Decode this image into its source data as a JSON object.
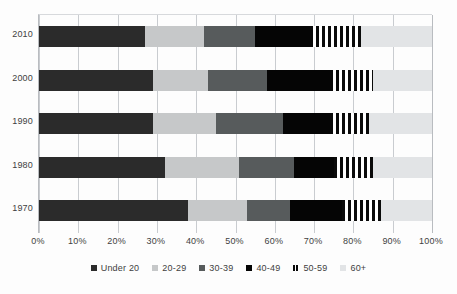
{
  "chart_data": {
    "type": "bar",
    "orientation": "horizontal",
    "stacked": true,
    "normalized": true,
    "title": "",
    "subtitle": "",
    "xlabel": "",
    "ylabel": "",
    "xlim": [
      0,
      100
    ],
    "grid": true,
    "legend_position": "bottom",
    "categories": [
      "2010",
      "2000",
      "1990",
      "1980",
      "1970"
    ],
    "xticks": [
      "0%",
      "10%",
      "20%",
      "30%",
      "40%",
      "50%",
      "60%",
      "70%",
      "80%",
      "90%",
      "100%"
    ],
    "xtick_values": [
      0,
      10,
      20,
      30,
      40,
      50,
      60,
      70,
      80,
      90,
      100
    ],
    "series": [
      {
        "name": "Under 20",
        "color": "#2b2b2b",
        "values": [
          27,
          29,
          29,
          32,
          38
        ]
      },
      {
        "name": "20-29",
        "color": "#c6c8c9",
        "values": [
          15,
          14,
          16,
          19,
          15
        ]
      },
      {
        "name": "30-39",
        "color": "#575b5c",
        "values": [
          13,
          15,
          17,
          14,
          11
        ]
      },
      {
        "name": "40-49",
        "color": "#050505",
        "values": [
          14,
          16,
          12,
          10,
          13
        ]
      },
      {
        "name": "50-59",
        "color": "#0a0a0a",
        "pattern": "vertical-stripes",
        "values": [
          13,
          11,
          10,
          10,
          10
        ]
      },
      {
        "name": "60+",
        "color": "#e2e4e6",
        "values": [
          18,
          15,
          16,
          15,
          13
        ]
      }
    ]
  },
  "legend": {
    "items": [
      {
        "label": "Under 20"
      },
      {
        "label": "20-29"
      },
      {
        "label": "30-39"
      },
      {
        "label": "40-49"
      },
      {
        "label": "50-59"
      },
      {
        "label": "60+"
      }
    ]
  }
}
